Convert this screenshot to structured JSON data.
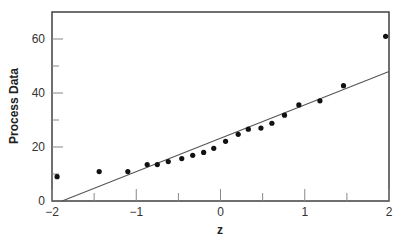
{
  "chart_data": {
    "type": "scatter",
    "title": "",
    "xlabel": "z",
    "ylabel": "Process Data",
    "xlim": [
      -2,
      2
    ],
    "ylim": [
      0,
      70
    ],
    "grid": false,
    "legend": null,
    "x_ticks": [
      -2,
      -1.5,
      -1,
      -0.5,
      0,
      0.5,
      1,
      1.5,
      2
    ],
    "x_tick_labels": [
      "−2",
      "",
      "−1",
      "",
      "0",
      "",
      "1",
      "",
      "2"
    ],
    "y_ticks": [
      0,
      10,
      20,
      30,
      40,
      50,
      60
    ],
    "y_tick_labels": [
      "0",
      "",
      "20",
      "",
      "40",
      "",
      "60"
    ],
    "series": [
      {
        "name": "Process Data",
        "kind": "points",
        "x": [
          -1.94,
          -1.44,
          -1.1,
          -0.87,
          -0.75,
          -0.62,
          -0.46,
          -0.33,
          -0.2,
          -0.08,
          0.06,
          0.21,
          0.33,
          0.48,
          0.61,
          0.76,
          0.93,
          1.18,
          1.46,
          1.96
        ],
        "y": [
          9.0,
          10.9,
          10.9,
          13.5,
          13.5,
          14.6,
          15.7,
          16.9,
          18.0,
          19.5,
          22.1,
          24.7,
          26.6,
          27.0,
          28.8,
          31.8,
          35.6,
          37.1,
          42.7,
          61.0
        ]
      },
      {
        "name": "Fitted line",
        "kind": "line",
        "x": [
          -1.88,
          2.0
        ],
        "y": [
          0,
          48
        ]
      }
    ]
  }
}
